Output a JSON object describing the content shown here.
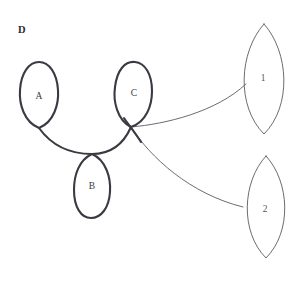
{
  "figure": {
    "panel_label": "D",
    "background_color": "#ffffff",
    "width": 297,
    "height": 281,
    "thick_stroke_color": "#3a3a42",
    "thin_stroke_color": "#5a5a63",
    "thick_stroke_width": 2.1,
    "thin_stroke_width": 0.9
  },
  "loops": [
    {
      "id": "loop-a",
      "label": "A",
      "label_x": 39,
      "label_y": 97,
      "style": "thick-teardrop-down",
      "tip_x": 39,
      "tip_y": 128,
      "path": "M 39 128 C 24 122 19 104 20 90 C 21 73 29 62 39 62 C 49 62 57 73 58 90 C 59 104 54 122 39 128 Z"
    },
    {
      "id": "loop-c",
      "label": "C",
      "label_x": 134,
      "label_y": 94,
      "style": "thick-teardrop-down-crossing",
      "tip_x": 131,
      "tip_y": 127,
      "path": "M 131 127 C 117 120 113 101 115 87 C 117 70 125 61 135 62 C 145 63 152 74 152 91 C 152 106 146 122 131 127 Z"
    },
    {
      "id": "loop-b",
      "label": "B",
      "label_x": 92,
      "label_y": 187,
      "style": "thick-teardrop-up",
      "tip_x": 92,
      "tip_y": 154,
      "path": "M 92 154 C 106 160 111 178 110 192 C 109 208 101 218 91 218 C 81 218 74 207 74 190 C 74 175 79 160 92 154 Z"
    }
  ],
  "arcs": [
    {
      "id": "arc-a-to-c",
      "style": "thick",
      "description": "catenary arc from loop A tip through loop B tip to loop C crossing",
      "path": "M 39 128 C 52 146 70 154 92 154 C 112 154 124 143 131 127"
    },
    {
      "id": "arc-c-crossing-tail",
      "style": "thick",
      "description": "short crossing tail below loop C",
      "path": "M 124 118 C 128 124 136 134 141 142"
    }
  ],
  "vesicas": [
    {
      "id": "vesica-1",
      "label": "1",
      "label_x": 263,
      "label_y": 79,
      "style": "thin-lens",
      "top_x": 264,
      "top_y": 24,
      "bottom_x": 264,
      "bottom_y": 134,
      "path": "M 264 24 C 289 52 292 106 264 134 C 236 106 239 52 264 24 Z"
    },
    {
      "id": "vesica-2",
      "label": "2",
      "label_x": 265,
      "label_y": 210,
      "style": "thin-lens",
      "top_x": 266,
      "top_y": 156,
      "bottom_x": 266,
      "bottom_y": 258,
      "path": "M 266 156 C 290 182 292 232 266 258 C 240 232 242 182 266 156 Z"
    }
  ],
  "connectors": [
    {
      "id": "connector-c-to-1",
      "from": "loop-c",
      "to": "vesica-1",
      "style": "thin",
      "path": "M 131 127 C 166 124 216 112 246 84"
    },
    {
      "id": "connector-c-to-2",
      "from": "loop-c",
      "to": "vesica-2",
      "style": "thin",
      "path": "M 131 127 C 150 157 190 194 243 207"
    }
  ]
}
